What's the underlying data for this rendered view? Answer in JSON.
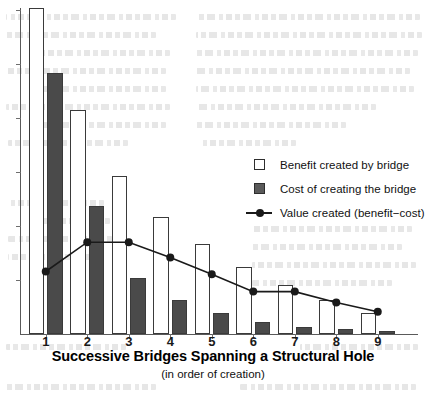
{
  "chart_data": {
    "type": "bar",
    "title": "Successive Bridges Spanning a Structural Hole",
    "subtitle": "(in order of creation)",
    "xlabel": "Successive Bridges Spanning a Structural Hole",
    "ylabel": "",
    "categories": [
      "1",
      "2",
      "3",
      "4",
      "5",
      "6",
      "7",
      "8",
      "9"
    ],
    "ylim": [
      0,
      6
    ],
    "y_tick_count": 6,
    "y_tick_labels_shown": false,
    "grid": false,
    "legend_position": "inside-right",
    "series": [
      {
        "name": "Benefit created by bridge",
        "type": "bar",
        "style": "open",
        "values": [
          6.0,
          4.13,
          2.9,
          2.16,
          1.65,
          1.23,
          0.91,
          0.63,
          0.39
        ]
      },
      {
        "name": "Cost of creating the bridge",
        "type": "bar",
        "style": "filled",
        "values": [
          4.81,
          2.36,
          1.04,
          0.63,
          0.39,
          0.22,
          0.13,
          0.09,
          0.06
        ]
      },
      {
        "name": "Value created (benefit−cost)",
        "type": "line",
        "style": "line-marker",
        "values": [
          1.15,
          1.69,
          1.69,
          1.41,
          1.1,
          0.78,
          0.78,
          0.58,
          0.41
        ]
      }
    ]
  },
  "legend": {
    "items": [
      {
        "label": "Benefit created by bridge",
        "key": "open-square-key"
      },
      {
        "label": "Cost of creating the bridge",
        "key": "filled-square-key"
      },
      {
        "label": "Value created (benefit−cost)",
        "key": "line-marker-key"
      }
    ]
  },
  "axis": {
    "x_title": "Successive Bridges Spanning a Structural Hole",
    "x_subtitle": "(in order of creation)",
    "x_labels": [
      "1",
      "2",
      "3",
      "4",
      "5",
      "6",
      "7",
      "8",
      "9"
    ]
  },
  "colors": {
    "benefit_fill": "#ffffff",
    "benefit_stroke": "#3a3a3a",
    "cost_fill": "#4a4a4a",
    "line": "#1a1a1a",
    "axis": "#5a5a5a",
    "text": "#111111"
  }
}
